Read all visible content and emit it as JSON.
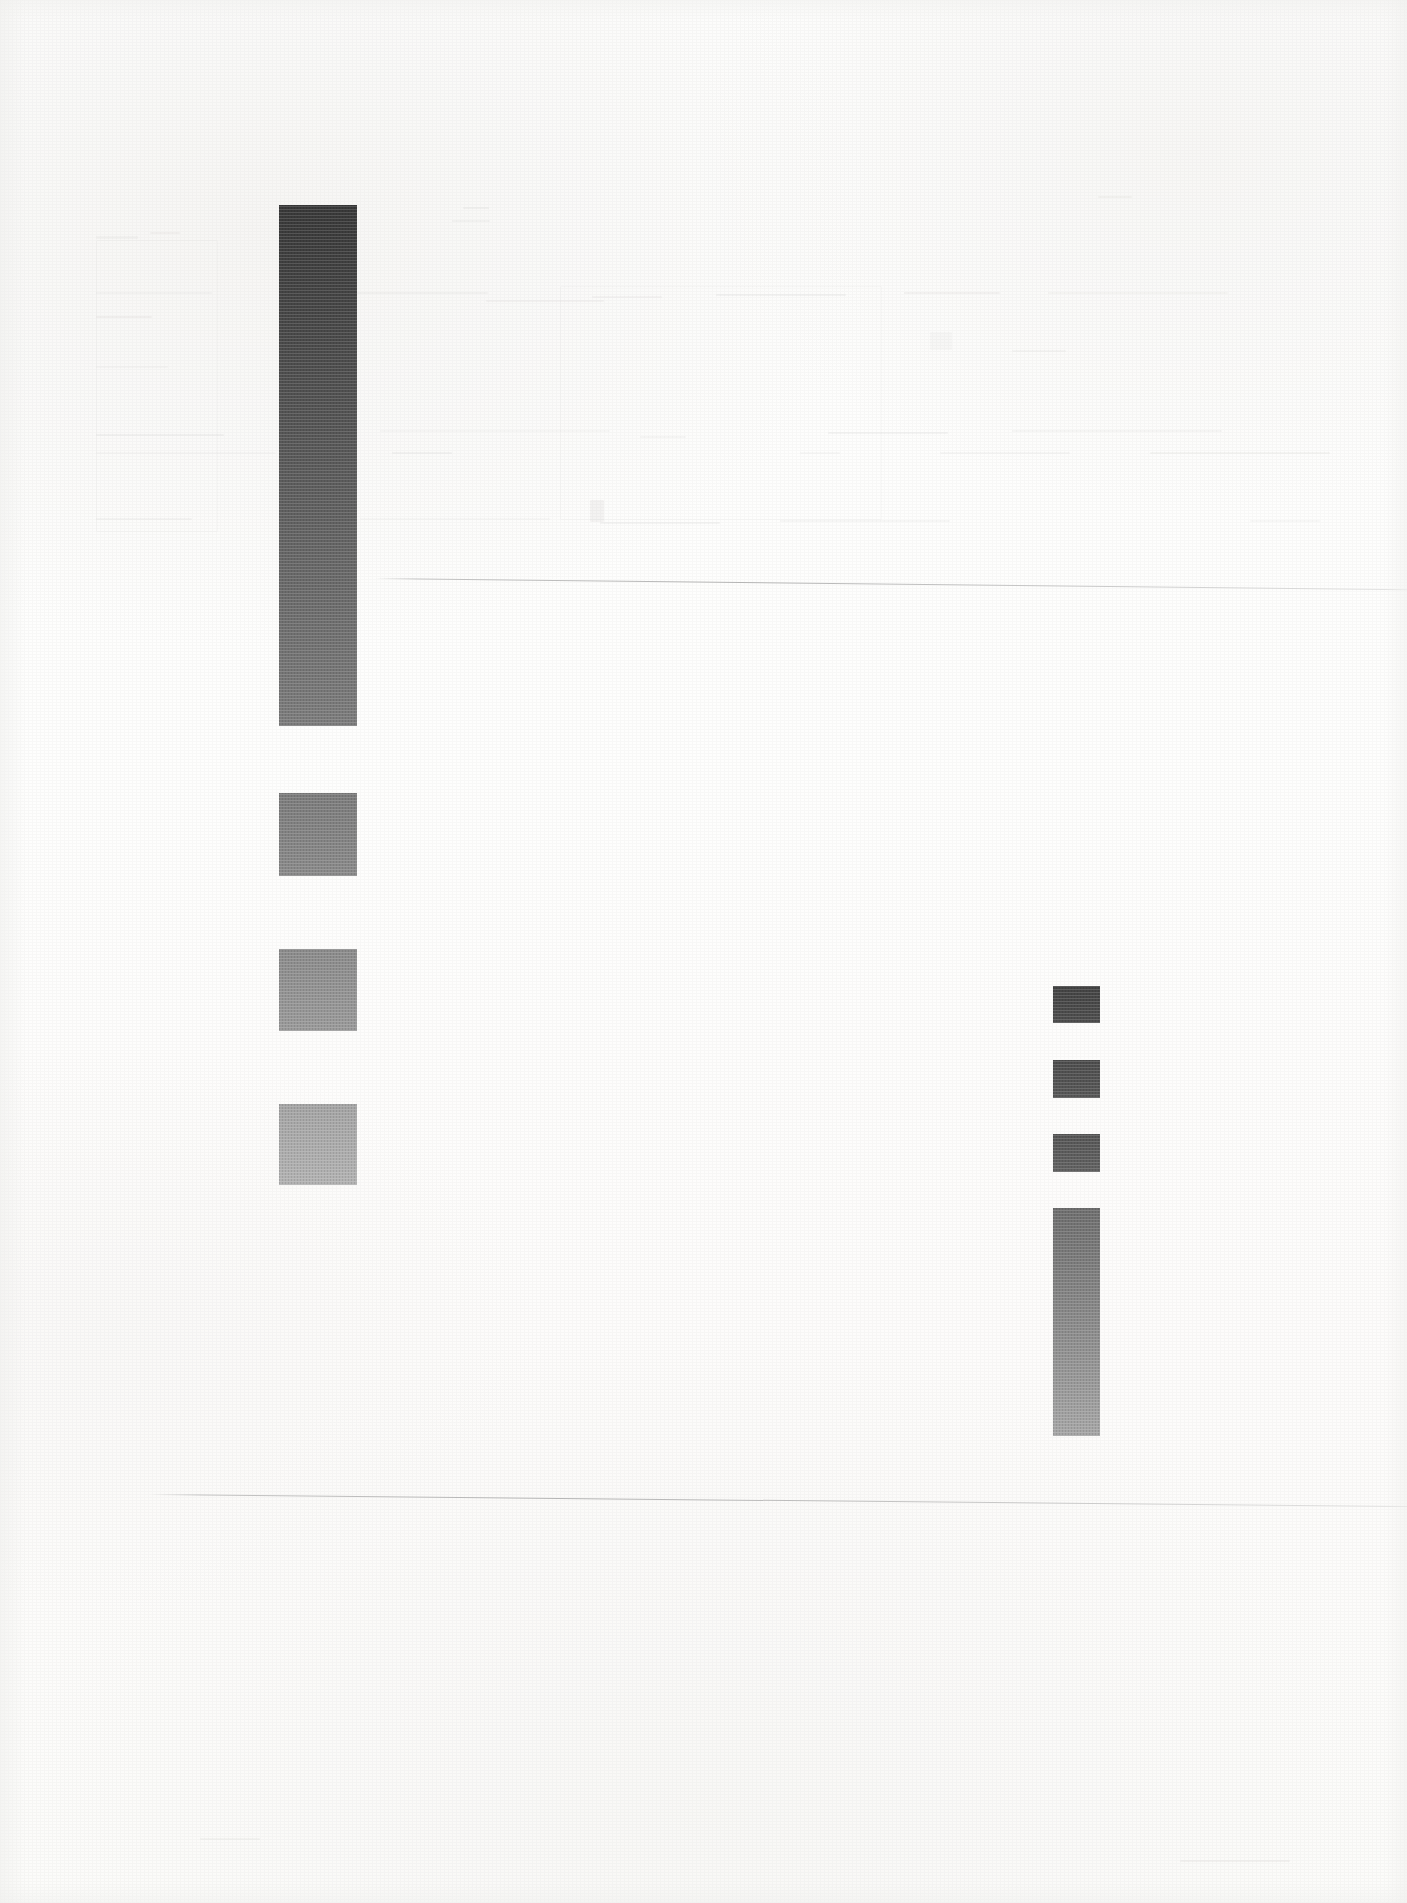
{
  "document": {
    "kind": "scanned-page",
    "title": "Faded scanned page with solid gray blocks",
    "width": 1407,
    "height": 1903,
    "background_color": "#fdfdfc",
    "condition": "heavily bleached; body text illegible, only solid ink blocks and two faint ruled hairlines remain"
  },
  "chart_data": {
    "type": "bar",
    "subtitle": "",
    "xlabel": "",
    "ylabel": "",
    "orientation": "vertical",
    "grid": false,
    "legend": "none",
    "axis_ranges": {
      "x": [
        0,
        1407
      ],
      "y": [
        0,
        1903
      ]
    },
    "note": "Values are pixel geometry of the solid ink blocks read off the scan; no axis tick labels are present in the image.",
    "series": [
      {
        "name": "left-column-blocks",
        "values": [
          521,
          83,
          82,
          81
        ],
        "units": "px height"
      },
      {
        "name": "right-column-blocks",
        "values": [
          37,
          38,
          38,
          228
        ],
        "units": "px height"
      }
    ],
    "categories": [
      "block-1",
      "block-2",
      "block-3",
      "block-4"
    ]
  },
  "blocks": {
    "left_column": {
      "name": "left-block-column",
      "x": 279,
      "width": 78,
      "items": [
        {
          "label": "left-block-1",
          "top": 205,
          "height": 521,
          "color_top": "#383838",
          "color_bottom": "#7c7c7c"
        },
        {
          "label": "left-block-2",
          "top": 793,
          "height": 83,
          "color_top": "#7b7b7b",
          "color_bottom": "#8a8a8a"
        },
        {
          "label": "left-block-3",
          "top": 949,
          "height": 82,
          "color_top": "#8b8b8b",
          "color_bottom": "#9a9a9a"
        },
        {
          "label": "left-block-4",
          "top": 1104,
          "height": 81,
          "color_top": "#a4a4a4",
          "color_bottom": "#b2b2b2"
        }
      ]
    },
    "right_column": {
      "name": "right-block-column",
      "x": 1053,
      "width": 47,
      "items": [
        {
          "label": "right-block-1",
          "top": 986,
          "height": 37,
          "color_top": "#434343",
          "color_bottom": "#4e4e4e"
        },
        {
          "label": "right-block-2",
          "top": 1060,
          "height": 38,
          "color_top": "#4c4c4c",
          "color_bottom": "#585858"
        },
        {
          "label": "right-block-3",
          "top": 1134,
          "height": 38,
          "color_top": "#555555",
          "color_bottom": "#626262"
        },
        {
          "label": "right-block-4",
          "top": 1208,
          "height": 228,
          "color_top": "#6e6e6e",
          "color_bottom": "#a6a6a6"
        }
      ]
    }
  },
  "hairlines": [
    {
      "label": "upper-hairline",
      "x": 375,
      "y": 578,
      "length": 1032,
      "slope_deg": 0.62
    },
    {
      "label": "lower-hairline",
      "x": 150,
      "y": 1494,
      "length": 1257,
      "slope_deg": 0.55
    }
  ],
  "ghost_text": {
    "note": "Residual bleached ink; no characters are legible at any magnification.",
    "rows": [
      {
        "x": 96,
        "y": 236,
        "w": 42,
        "h": 3
      },
      {
        "x": 150,
        "y": 232,
        "w": 30,
        "h": 2
      },
      {
        "x": 452,
        "y": 220,
        "w": 38,
        "h": 2
      },
      {
        "x": 463,
        "y": 207,
        "w": 26,
        "h": 2
      },
      {
        "x": 1098,
        "y": 196,
        "w": 34,
        "h": 2
      },
      {
        "x": 96,
        "y": 292,
        "w": 116,
        "h": 2
      },
      {
        "x": 300,
        "y": 292,
        "w": 188,
        "h": 2
      },
      {
        "x": 592,
        "y": 296,
        "w": 70,
        "h": 2
      },
      {
        "x": 716,
        "y": 294,
        "w": 130,
        "h": 2
      },
      {
        "x": 904,
        "y": 292,
        "w": 96,
        "h": 2
      },
      {
        "x": 1048,
        "y": 292,
        "w": 180,
        "h": 2
      },
      {
        "x": 96,
        "y": 316,
        "w": 56,
        "h": 2
      },
      {
        "x": 486,
        "y": 300,
        "w": 118,
        "h": 2
      },
      {
        "x": 96,
        "y": 366,
        "w": 72,
        "h": 2
      },
      {
        "x": 1012,
        "y": 350,
        "w": 54,
        "h": 2
      },
      {
        "x": 96,
        "y": 434,
        "w": 128,
        "h": 2
      },
      {
        "x": 380,
        "y": 430,
        "w": 230,
        "h": 2
      },
      {
        "x": 640,
        "y": 436,
        "w": 46,
        "h": 2
      },
      {
        "x": 828,
        "y": 432,
        "w": 120,
        "h": 2
      },
      {
        "x": 1012,
        "y": 430,
        "w": 210,
        "h": 2
      },
      {
        "x": 96,
        "y": 452,
        "w": 180,
        "h": 2
      },
      {
        "x": 392,
        "y": 452,
        "w": 60,
        "h": 2
      },
      {
        "x": 800,
        "y": 452,
        "w": 40,
        "h": 2
      },
      {
        "x": 940,
        "y": 452,
        "w": 130,
        "h": 2
      },
      {
        "x": 1150,
        "y": 452,
        "w": 180,
        "h": 2
      },
      {
        "x": 96,
        "y": 518,
        "w": 96,
        "h": 2
      },
      {
        "x": 360,
        "y": 518,
        "w": 190,
        "h": 2
      },
      {
        "x": 600,
        "y": 522,
        "w": 120,
        "h": 2
      },
      {
        "x": 780,
        "y": 520,
        "w": 170,
        "h": 2
      },
      {
        "x": 1250,
        "y": 520,
        "w": 70,
        "h": 2
      },
      {
        "x": 930,
        "y": 332,
        "w": 22,
        "h": 18
      },
      {
        "x": 590,
        "y": 500,
        "w": 14,
        "h": 22
      },
      {
        "x": 1180,
        "y": 1860,
        "w": 110,
        "h": 2
      },
      {
        "x": 200,
        "y": 1838,
        "w": 60,
        "h": 2
      }
    ],
    "frames": [
      {
        "x": 96,
        "y": 240,
        "w": 120,
        "h": 290
      },
      {
        "x": 560,
        "y": 286,
        "w": 320,
        "h": 232
      }
    ]
  }
}
